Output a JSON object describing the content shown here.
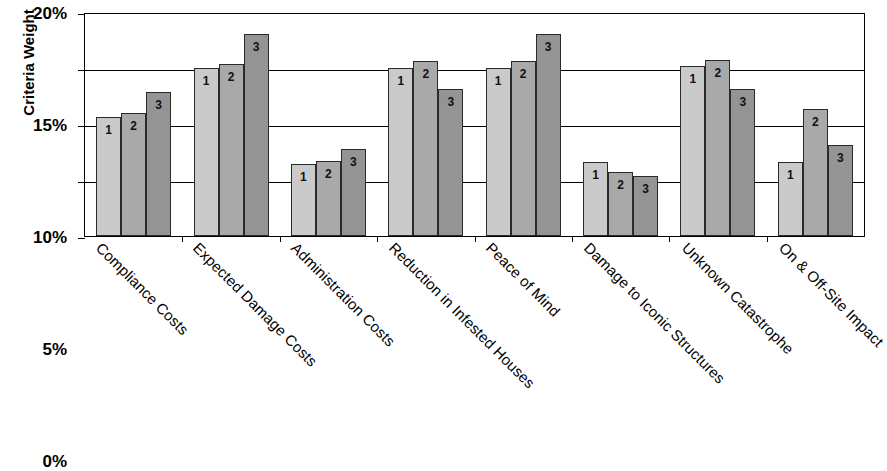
{
  "chart_data": {
    "type": "bar",
    "title": "",
    "xlabel": "",
    "ylabel": "Criteria Weight",
    "ylim": [
      0,
      20
    ],
    "ytick_labels": [
      "0%",
      "5%",
      "10%",
      "15%",
      "20%"
    ],
    "ytick_values": [
      0,
      5,
      10,
      15,
      20
    ],
    "grid": true,
    "legend": "none",
    "bar_value_labels": [
      "1",
      "2",
      "3"
    ],
    "categories": [
      "Compliance Costs",
      "Expected Damage Costs",
      "Administration Costs",
      "Reduction in Infested Houses",
      "Peace of Mind",
      "Damage to Iconic Structures",
      "Unknown Catastrophe",
      "On & Off-Site Impact"
    ],
    "series": [
      {
        "name": "1",
        "color": "#cacaca",
        "values": [
          10.6,
          15.0,
          6.4,
          15.0,
          15.0,
          6.6,
          15.2,
          6.6
        ]
      },
      {
        "name": "2",
        "color": "#a9a9a9",
        "values": [
          11.0,
          15.4,
          6.7,
          15.6,
          15.6,
          5.7,
          15.7,
          11.3
        ]
      },
      {
        "name": "3",
        "color": "#949494",
        "values": [
          12.9,
          18.0,
          7.8,
          13.1,
          18.0,
          5.4,
          13.1,
          8.1
        ]
      }
    ]
  }
}
